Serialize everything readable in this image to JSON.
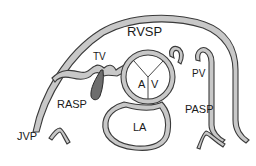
{
  "diagram": {
    "type": "cardiac cross-section schematic",
    "labels": {
      "rvsp": "RVSP",
      "tv": "TV",
      "pv": "PV",
      "rasp": "RASP",
      "pasp": "PASP",
      "jvp": "JVP",
      "la": "LA",
      "av_a": "A",
      "av_v": "V"
    },
    "colors": {
      "wall_fill": "#c8c8c8",
      "outline": "#3a3a3a",
      "leaflet": "#6e6e6e",
      "background": "#ffffff"
    }
  }
}
